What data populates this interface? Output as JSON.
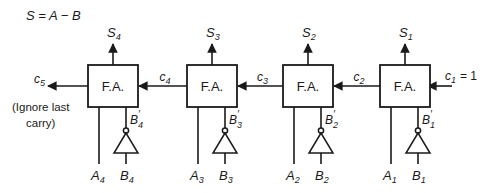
{
  "equation": "S = A − B",
  "adder_label": "F.A.",
  "stages": [
    {
      "sum": "S",
      "sum_sub": "4",
      "a": "A",
      "a_sub": "4",
      "b": "B",
      "b_sub": "4",
      "bprime": "B",
      "bprime_sub": "4",
      "carry_in": "c",
      "carry_in_sub": "4"
    },
    {
      "sum": "S",
      "sum_sub": "3",
      "a": "A",
      "a_sub": "3",
      "b": "B",
      "b_sub": "3",
      "bprime": "B",
      "bprime_sub": "3",
      "carry_in": "c",
      "carry_in_sub": "3"
    },
    {
      "sum": "S",
      "sum_sub": "2",
      "a": "A",
      "a_sub": "2",
      "b": "B",
      "b_sub": "2",
      "bprime": "B",
      "bprime_sub": "2",
      "carry_in": "c",
      "carry_in_sub": "2"
    },
    {
      "sum": "S",
      "sum_sub": "1",
      "a": "A",
      "a_sub": "1",
      "b": "B",
      "b_sub": "1",
      "bprime": "B",
      "bprime_sub": "1",
      "carry_in": "c",
      "carry_in_sub": "1"
    }
  ],
  "carry_out": {
    "name": "c",
    "sub": "5"
  },
  "carry_first": {
    "name": "c",
    "sub": "1",
    "value": "= 1"
  },
  "prime_mark": "′",
  "note_line1": "(Ignore last",
  "note_line2": "carry)"
}
